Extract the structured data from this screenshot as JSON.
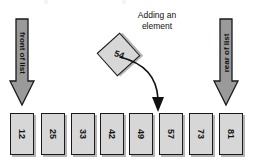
{
  "diagram": {
    "title_caption": {
      "line1": "Adding an",
      "line2": "element"
    },
    "front_arrow": {
      "label": "front of list",
      "icon": "down-arrow-icon",
      "fill": "#9a9a9a",
      "stroke": "#1a1a1a"
    },
    "rear_arrow": {
      "label": "rear of list",
      "icon": "down-arrow-icon",
      "fill": "#9a9a9a",
      "stroke": "#1a1a1a"
    },
    "new_element": {
      "value": "54",
      "fill": "#d7d7d7",
      "stroke": "#1a1a1a"
    },
    "insertion_arrow": {
      "icon": "curved-down-arrow-icon",
      "stroke": "#111111"
    },
    "list": {
      "box_fill": "#d7d7d7",
      "box_stroke": "#1a1a1a",
      "items": [
        {
          "value": "12"
        },
        {
          "value": "25"
        },
        {
          "value": "33"
        },
        {
          "value": "42"
        },
        {
          "value": "49"
        },
        {
          "value": "57"
        },
        {
          "value": "73"
        },
        {
          "value": "81"
        }
      ]
    }
  }
}
